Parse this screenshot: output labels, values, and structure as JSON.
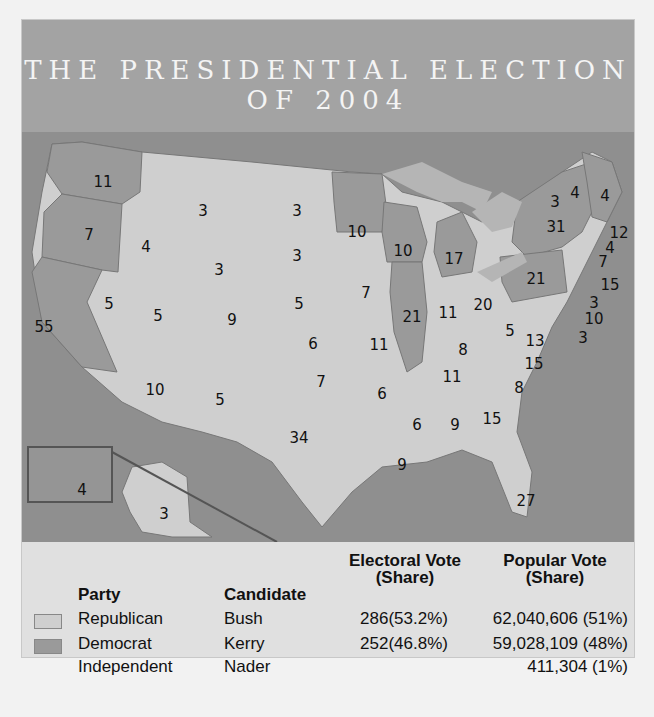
{
  "title": {
    "line1": "THE PRESIDENTIAL ELECTION",
    "line2": "OF 2004"
  },
  "colors": {
    "republican": "#cfcfcf",
    "democrat": "#9a9a9a",
    "water": "#8f8f8f",
    "title_bg": "#a3a3a3"
  },
  "map": {
    "states": [
      {
        "label": "11",
        "x": 81,
        "y": 50,
        "party": "D"
      },
      {
        "label": "7",
        "x": 67,
        "y": 103,
        "party": "D"
      },
      {
        "label": "55",
        "x": 22,
        "y": 195,
        "party": "D"
      },
      {
        "label": "4",
        "x": 124,
        "y": 115,
        "party": "R"
      },
      {
        "label": "3",
        "x": 181,
        "y": 79,
        "party": "R"
      },
      {
        "label": "3",
        "x": 275,
        "y": 79,
        "party": "R"
      },
      {
        "label": "3",
        "x": 275,
        "y": 124,
        "party": "R"
      },
      {
        "label": "3",
        "x": 197,
        "y": 138,
        "party": "R"
      },
      {
        "label": "5",
        "x": 87,
        "y": 172,
        "party": "R"
      },
      {
        "label": "5",
        "x": 136,
        "y": 184,
        "party": "R"
      },
      {
        "label": "9",
        "x": 210,
        "y": 188,
        "party": "R"
      },
      {
        "label": "5",
        "x": 277,
        "y": 172,
        "party": "R"
      },
      {
        "label": "6",
        "x": 291,
        "y": 212,
        "party": "R"
      },
      {
        "label": "10",
        "x": 133,
        "y": 258,
        "party": "R"
      },
      {
        "label": "5",
        "x": 198,
        "y": 268,
        "party": "R"
      },
      {
        "label": "7",
        "x": 299,
        "y": 250,
        "party": "R"
      },
      {
        "label": "34",
        "x": 277,
        "y": 306,
        "party": "R"
      },
      {
        "label": "10",
        "x": 335,
        "y": 100,
        "party": "D"
      },
      {
        "label": "10",
        "x": 381,
        "y": 119,
        "party": "D"
      },
      {
        "label": "7",
        "x": 344,
        "y": 161,
        "party": "R"
      },
      {
        "label": "11",
        "x": 357,
        "y": 213,
        "party": "R"
      },
      {
        "label": "21",
        "x": 390,
        "y": 185,
        "party": "D"
      },
      {
        "label": "6",
        "x": 360,
        "y": 262,
        "party": "R"
      },
      {
        "label": "9",
        "x": 380,
        "y": 333,
        "party": "R"
      },
      {
        "label": "17",
        "x": 432,
        "y": 127,
        "party": "D"
      },
      {
        "label": "11",
        "x": 426,
        "y": 181,
        "party": "R"
      },
      {
        "label": "20",
        "x": 461,
        "y": 173,
        "party": "R"
      },
      {
        "label": "8",
        "x": 441,
        "y": 218,
        "party": "R"
      },
      {
        "label": "11",
        "x": 430,
        "y": 245,
        "party": "R"
      },
      {
        "label": "6",
        "x": 395,
        "y": 293,
        "party": "R"
      },
      {
        "label": "9",
        "x": 433,
        "y": 293,
        "party": "R"
      },
      {
        "label": "15",
        "x": 470,
        "y": 287,
        "party": "R"
      },
      {
        "label": "27",
        "x": 504,
        "y": 369,
        "party": "R"
      },
      {
        "label": "5",
        "x": 488,
        "y": 199,
        "party": "R"
      },
      {
        "label": "13",
        "x": 513,
        "y": 209,
        "party": "R"
      },
      {
        "label": "15",
        "x": 512,
        "y": 232,
        "party": "R"
      },
      {
        "label": "8",
        "x": 497,
        "y": 256,
        "party": "R"
      },
      {
        "label": "21",
        "x": 514,
        "y": 147,
        "party": "D"
      },
      {
        "label": "31",
        "x": 534,
        "y": 95,
        "party": "D"
      },
      {
        "label": "4",
        "x": 60,
        "y": 358,
        "party": "D"
      },
      {
        "label": "3",
        "x": 142,
        "y": 382,
        "party": "R"
      }
    ],
    "callouts": [
      {
        "label": "3",
        "x": 533,
        "y": 70
      },
      {
        "label": "4",
        "x": 553,
        "y": 61
      },
      {
        "label": "4",
        "x": 583,
        "y": 64
      },
      {
        "label": "12",
        "x": 597,
        "y": 101
      },
      {
        "label": "4",
        "x": 588,
        "y": 116
      },
      {
        "label": "7",
        "x": 581,
        "y": 130
      },
      {
        "label": "15",
        "x": 588,
        "y": 153
      },
      {
        "label": "3",
        "x": 572,
        "y": 171
      },
      {
        "label": "10",
        "x": 572,
        "y": 187
      },
      {
        "label": "3",
        "x": 561,
        "y": 206
      }
    ]
  },
  "legend": {
    "headers": {
      "party": "Party",
      "candidate": "Candidate",
      "electoral_1": "Electoral Vote",
      "electoral_2": "(Share)",
      "popular_1": "Popular Vote",
      "popular_2": "(Share)"
    },
    "rows": [
      {
        "party": "Republican",
        "candidate": "Bush",
        "electoral": "286(53.2%)",
        "popular": "62,040,606 (51%)",
        "swatch": "#cfcfcf"
      },
      {
        "party": "Democrat",
        "candidate": "Kerry",
        "electoral": "252(46.8%)",
        "popular": "59,028,109 (48%)",
        "swatch": "#9a9a9a"
      },
      {
        "party": "Independent",
        "candidate": "Nader",
        "electoral": "",
        "popular": "411,304 (1%)",
        "swatch": ""
      }
    ]
  }
}
